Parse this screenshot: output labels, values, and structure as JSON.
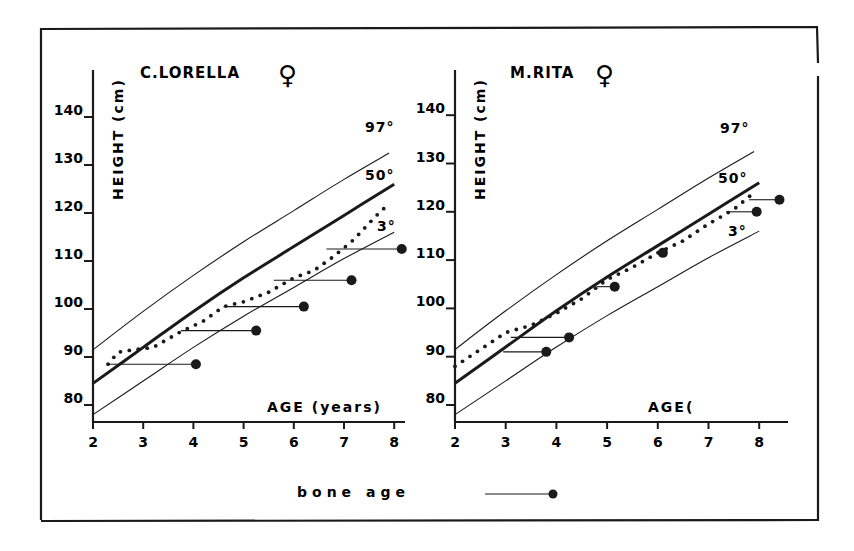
{
  "figure": {
    "legend": {
      "label": "bone age",
      "marker": "line-with-filled-circle"
    },
    "colors": {
      "ink": "#1a1a1a",
      "background": "#ffffff"
    }
  },
  "chart_data": [
    {
      "type": "line",
      "title": "C.LORELLA",
      "sex_symbol": "♀",
      "xlabel": "AGE (years)",
      "ylabel": "HEIGHT (cm)",
      "x_ticks": [
        2,
        3,
        4,
        5,
        6,
        7,
        8
      ],
      "y_ticks": [
        80,
        90,
        100,
        110,
        120,
        130,
        140
      ],
      "xlim": [
        2,
        8.3
      ],
      "ylim": [
        77,
        145
      ],
      "percentile_labels": [
        "97°",
        "50°",
        "3°"
      ],
      "series": [
        {
          "name": "97th percentile",
          "style": "thin",
          "x": [
            2,
            3,
            4,
            5,
            6,
            7,
            7.9
          ],
          "y": [
            91.5,
            99.5,
            107,
            114,
            120.5,
            127,
            132.5
          ]
        },
        {
          "name": "50th percentile",
          "style": "thick",
          "x": [
            2,
            3,
            4,
            5,
            6,
            7,
            8
          ],
          "y": [
            84.5,
            92,
            99.5,
            106.5,
            113,
            119.5,
            126
          ]
        },
        {
          "name": "3rd percentile",
          "style": "thin",
          "x": [
            2,
            3,
            4,
            5,
            6,
            7,
            8
          ],
          "y": [
            78,
            85,
            92,
            98.5,
            104.5,
            110.5,
            116
          ]
        },
        {
          "name": "patient height",
          "style": "dotted",
          "x": [
            2.3,
            2.5,
            2.8,
            3.2,
            3.7,
            4.2,
            4.6,
            5.0,
            5.5,
            6.0,
            6.4,
            6.8,
            7.2,
            7.6,
            7.8
          ],
          "y": [
            88.5,
            91,
            91.5,
            92,
            95,
            97.5,
            100.5,
            101.5,
            103.5,
            106.5,
            108,
            111,
            114.5,
            119,
            121
          ]
        }
      ],
      "bone_age": [
        {
          "chrono_age": 2.3,
          "height": 88.5,
          "bone_age": 4.05
        },
        {
          "chrono_age": 3.75,
          "height": 95.5,
          "bone_age": 5.25
        },
        {
          "chrono_age": 4.6,
          "height": 100.5,
          "bone_age": 6.2
        },
        {
          "chrono_age": 5.6,
          "height": 106.0,
          "bone_age": 7.15
        },
        {
          "chrono_age": 6.65,
          "height": 112.5,
          "bone_age": 8.15
        }
      ]
    },
    {
      "type": "line",
      "title": "M.RITA",
      "sex_symbol": "♀",
      "xlabel": "AGE(",
      "ylabel": "HEIGHT (cm)",
      "x_ticks": [
        2,
        3,
        "4",
        5,
        6,
        7,
        8
      ],
      "y_ticks": [
        80,
        90,
        100,
        110,
        120,
        130,
        140
      ],
      "xlim": [
        2,
        8.6
      ],
      "ylim": [
        77,
        145
      ],
      "percentile_labels": [
        "97°",
        "50°",
        "3°"
      ],
      "series": [
        {
          "name": "97th percentile",
          "style": "thin",
          "x": [
            2,
            3,
            4,
            5,
            6,
            7,
            7.9
          ],
          "y": [
            91.5,
            99.5,
            107,
            114,
            120.5,
            127,
            132.5
          ]
        },
        {
          "name": "50th percentile",
          "style": "thick",
          "x": [
            2,
            3,
            4,
            5,
            6,
            7,
            8
          ],
          "y": [
            84.5,
            92,
            99.5,
            106.5,
            113,
            119.5,
            126
          ]
        },
        {
          "name": "3rd percentile",
          "style": "thin",
          "x": [
            2,
            3,
            4,
            5,
            6,
            7,
            8
          ],
          "y": [
            78,
            85,
            92,
            98.5,
            104.5,
            110.5,
            116
          ]
        },
        {
          "name": "patient height",
          "style": "dotted",
          "x": [
            2.0,
            2.5,
            3.0,
            3.5,
            4.0,
            4.5,
            5.0,
            5.5,
            6.0,
            6.5,
            7.0,
            7.5,
            7.9
          ],
          "y": [
            88,
            91.5,
            95,
            96.5,
            99,
            102,
            106,
            108.5,
            111.5,
            114,
            117.5,
            120.5,
            124
          ]
        }
      ],
      "bone_age": [
        {
          "chrono_age": 2.95,
          "height": 91.0,
          "bone_age": 3.8
        },
        {
          "chrono_age": 3.1,
          "height": 94.0,
          "bone_age": 4.25
        },
        {
          "chrono_age": 4.8,
          "height": 104.5,
          "bone_age": 5.15
        },
        {
          "chrono_age": 6.05,
          "height": 111.5,
          "bone_age": 6.1
        },
        {
          "chrono_age": 7.35,
          "height": 120.0,
          "bone_age": 7.95
        },
        {
          "chrono_age": 7.8,
          "height": 122.5,
          "bone_age": 8.4
        }
      ]
    }
  ]
}
